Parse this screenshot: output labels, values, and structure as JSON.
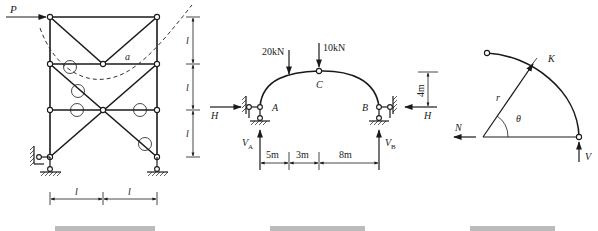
{
  "figure_left": {
    "load_label": "P",
    "member_label": "a",
    "dim_vertical_labels": [
      "l",
      "l",
      "l"
    ],
    "dim_horizontal_labels": [
      "l",
      "l"
    ]
  },
  "figure_middle": {
    "load_1": "20kN",
    "load_2": "10kN",
    "hinge_label": "C",
    "support_left_label": "A",
    "support_right_label": "B",
    "thrust_left": "H",
    "thrust_right": "H",
    "reaction_left": "V",
    "reaction_left_sub": "A",
    "reaction_right": "V",
    "reaction_right_sub": "B",
    "rise": "4m",
    "spans": [
      "5m",
      "3m",
      "8m"
    ]
  },
  "figure_right": {
    "section_label": "K",
    "radius_label": "r",
    "angle_label": "θ",
    "axial_label": "N",
    "shear_label": "V"
  },
  "colors": {
    "ink": "#1a1a1a",
    "background": "#ffffff"
  }
}
